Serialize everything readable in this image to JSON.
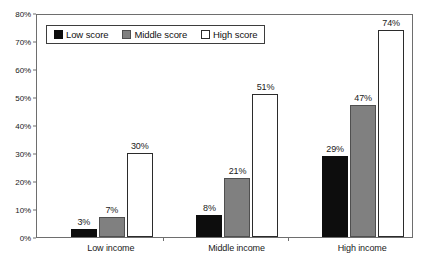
{
  "chart_data": {
    "type": "bar",
    "title": "",
    "subtitle": "",
    "xlabel": "",
    "ylabel": "",
    "categories": [
      "Low income",
      "Middle income",
      "High income"
    ],
    "series": [
      {
        "name": "Low score",
        "color": "#0d0d0d",
        "values": [
          3,
          7,
          29
        ]
      },
      {
        "name": "Middle score",
        "color": "#808080",
        "values": [
          7,
          21,
          47
        ]
      },
      {
        "name": "High score",
        "color": "#ffffff",
        "values": [
          30,
          51,
          74
        ]
      }
    ],
    "value_labels": [
      [
        "3%",
        "7%",
        "30%"
      ],
      [
        "8%",
        "21%",
        "51%"
      ],
      [
        "29%",
        "47%",
        "74%"
      ]
    ],
    "group_values": [
      [
        3,
        7,
        30
      ],
      [
        8,
        21,
        51
      ],
      [
        29,
        47,
        74
      ]
    ],
    "ylim": [
      0,
      80
    ],
    "ytick_values": [
      0,
      10,
      20,
      30,
      40,
      50,
      60,
      70,
      80
    ],
    "ytick_labels": [
      "0%",
      "10%",
      "20%",
      "30%",
      "40%",
      "50%",
      "60%",
      "70%",
      "80%"
    ],
    "grid": false,
    "legend_position": "top-left",
    "legend": [
      "Low score",
      "Middle score",
      "High score"
    ]
  },
  "legend": {
    "items": [
      {
        "label": "Low score",
        "swatch": "low"
      },
      {
        "label": "Middle score",
        "swatch": "middle"
      },
      {
        "label": "High score",
        "swatch": "high"
      }
    ]
  },
  "axis": {
    "y_labels": [
      "80%",
      "70%",
      "60%",
      "50%",
      "40%",
      "30%",
      "20%",
      "10%",
      "0%"
    ],
    "x_labels": [
      "Low income",
      "Middle income",
      "High income"
    ]
  }
}
